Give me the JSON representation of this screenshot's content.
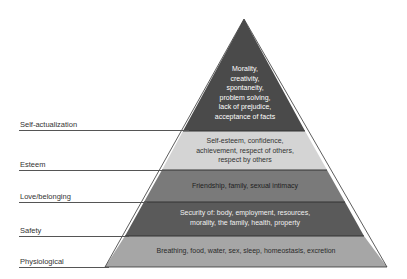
{
  "diagram": {
    "type": "pyramid",
    "levels": [
      {
        "name": "Self-actualization",
        "text_lines": [
          "Morality,",
          "creativity,",
          "spontaneity,",
          "problem solving,",
          "lack of prejudice,",
          "acceptance of facts"
        ],
        "fill": "#4a4a4a",
        "text_color": "#ffffff"
      },
      {
        "name": "Esteem",
        "text_lines": [
          "Self-esteem, confidence,",
          "achievement, respect of others,",
          "respect by others"
        ],
        "fill": "#d4d4d4",
        "text_color": "#333333"
      },
      {
        "name": "Love/belonging",
        "text_lines": [
          "Friendship, family, sexual intimacy"
        ],
        "fill": "#7a7a7a",
        "text_color": "#1e1e1e"
      },
      {
        "name": "Safety",
        "text_lines": [
          "Security of: body, employment, resources,",
          "morality, the family, health, property"
        ],
        "fill": "#5a5a5a",
        "text_color": "#f0f0f0"
      },
      {
        "name": "Physiological",
        "text_lines": [
          "Breathing, food, water, sex, sleep, homeostasis, excretion"
        ],
        "fill": "#a6a6a6",
        "text_color": "#2a2a2a"
      }
    ]
  }
}
